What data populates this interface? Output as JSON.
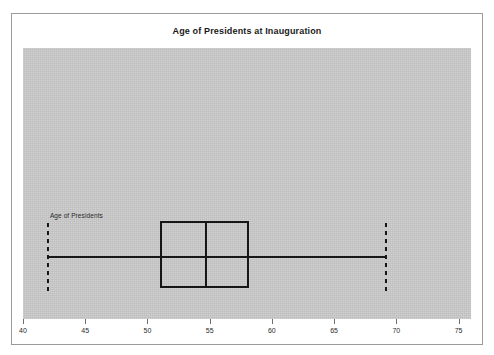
{
  "chart_data": {
    "type": "boxplot",
    "title": "Age of Presidents at Inauguration",
    "xlabel": "",
    "ylabel": "",
    "xlim": [
      40,
      76
    ],
    "xticks": [
      40,
      45,
      50,
      55,
      60,
      65,
      70,
      75
    ],
    "xtick_labels": [
      "40",
      "45",
      "50",
      "55",
      "60",
      "65",
      "70",
      "75"
    ],
    "grid": false,
    "legend": null,
    "orientation": "horizontal",
    "series": [
      {
        "name": "Age of Presidents",
        "min": 42,
        "q1": 51,
        "median": 54.7,
        "q3": 58.2,
        "max": 69.2,
        "outliers": []
      }
    ],
    "colors": {
      "plot_background": "#c9c9c9",
      "panel_background": "#ffffff",
      "line": "#161616",
      "axis": "#6e6e6e",
      "text": "#1a1a1a"
    }
  },
  "chart": {
    "title": "Age of Presidents at Inauguration",
    "series_label": "Age of Presidents",
    "ticks": [
      {
        "label": "40",
        "value": 40
      },
      {
        "label": "45",
        "value": 45
      },
      {
        "label": "50",
        "value": 50
      },
      {
        "label": "55",
        "value": 55
      },
      {
        "label": "60",
        "value": 60
      },
      {
        "label": "65",
        "value": 65
      },
      {
        "label": "70",
        "value": 70
      },
      {
        "label": "75",
        "value": 75
      }
    ]
  }
}
